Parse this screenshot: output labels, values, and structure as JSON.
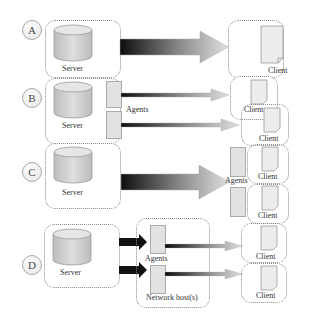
{
  "diagram": {
    "rows": [
      {
        "id": "A",
        "server_label": "Server",
        "clients": [
          {
            "label": "Client"
          }
        ]
      },
      {
        "id": "B",
        "server_label": "Server",
        "agents_label": "Agents",
        "clients": [
          {
            "label": "Client"
          },
          {
            "label": "Client"
          }
        ]
      },
      {
        "id": "C",
        "server_label": "Server",
        "agents_label": "Agents",
        "clients": [
          {
            "label": "Client"
          },
          {
            "label": "Client"
          }
        ]
      },
      {
        "id": "D",
        "server_label": "Server",
        "agents_label": "Agents",
        "host_label": "Network host(s)",
        "clients": [
          {
            "label": "Client"
          },
          {
            "label": "Client"
          }
        ]
      }
    ],
    "colors": {
      "box_border": "#888888",
      "cylinder_fill": "#d0d0d0",
      "arrow_dark": "#111111",
      "arrow_light": "#cfcfcf",
      "document_fill": "#ececec"
    }
  }
}
